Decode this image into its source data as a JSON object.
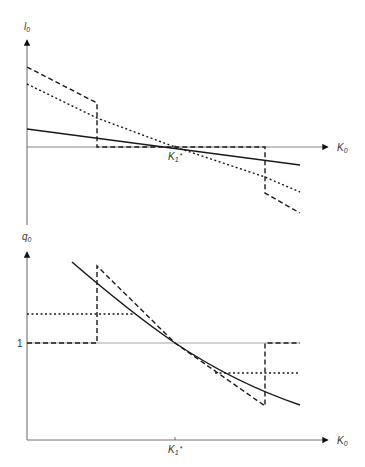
{
  "figure": {
    "top_panel": {
      "y_axis_label": "l",
      "y_axis_label_sub": "0",
      "x_axis_label": "K",
      "x_axis_label_sub": "0",
      "tick_label": "K",
      "tick_label_sub": "1",
      "tick_label_sup": "*",
      "series": [
        {
          "name": "dashed",
          "style": "dashed",
          "points": [
            [
              27,
              67
            ],
            [
              97,
              103
            ],
            [
              97,
              147
            ],
            [
              265,
              147
            ],
            [
              265,
              193
            ],
            [
              300,
              213
            ]
          ]
        },
        {
          "name": "dotted",
          "style": "dotted",
          "points": [
            [
              27,
              84
            ],
            [
              97,
              118
            ],
            [
              175,
              147
            ],
            [
              265,
              177
            ],
            [
              300,
              192
            ]
          ]
        },
        {
          "name": "solid",
          "style": "solid",
          "points": [
            [
              27,
              129
            ],
            [
              300,
              165
            ]
          ]
        }
      ]
    },
    "bottom_panel": {
      "y_axis_label": "q",
      "y_axis_label_sub": "0",
      "y_tick_label": "1",
      "x_axis_label": "K",
      "x_axis_label_sub": "0",
      "tick_label": "K",
      "tick_label_sub": "1",
      "tick_label_sup": "*",
      "series": [
        {
          "name": "dashed",
          "style": "dashed",
          "points": [
            [
              27,
              343
            ],
            [
              97,
              343
            ],
            [
              97,
              266
            ],
            [
              175,
              343
            ],
            [
              265,
              406
            ],
            [
              265,
              343
            ],
            [
              300,
              343
            ]
          ]
        },
        {
          "name": "dotted-left",
          "style": "dotted",
          "points": [
            [
              27,
              314
            ],
            [
              135,
              314
            ]
          ]
        },
        {
          "name": "dotted-right",
          "style": "dotted",
          "points": [
            [
              215,
              373
            ],
            [
              300,
              373
            ]
          ]
        },
        {
          "name": "solid",
          "style": "solid",
          "path": "M72,262 Q130,312 175,343 Q235,383 300,405"
        }
      ]
    },
    "colors": {
      "line": "#1a1a1a",
      "axis": "#555555",
      "ref_line": "#888888"
    }
  }
}
